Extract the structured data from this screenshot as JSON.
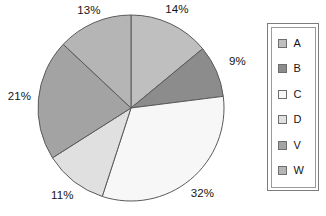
{
  "chart_data": {
    "type": "pie",
    "title": "",
    "legend_position": "right",
    "categories": [
      "A",
      "B",
      "C",
      "D",
      "V",
      "W"
    ],
    "values": [
      14,
      9,
      32,
      11,
      21,
      13
    ],
    "labels": [
      "14%",
      "9%",
      "32%",
      "11%",
      "21%",
      "13%"
    ],
    "colors": [
      "#bfbfbf",
      "#8c8c8c",
      "#f7f7f7",
      "#e0e0e0",
      "#a3a3a3",
      "#b5b5b5"
    ],
    "start_angle_deg": 0,
    "direction": "clockwise",
    "slices": [
      {
        "category": "A",
        "value": 14,
        "label": "14%",
        "color": "#bfbfbf"
      },
      {
        "category": "B",
        "value": 9,
        "label": "9%",
        "color": "#8c8c8c"
      },
      {
        "category": "C",
        "value": 32,
        "label": "32%",
        "color": "#f7f7f7"
      },
      {
        "category": "D",
        "value": 11,
        "label": "11%",
        "color": "#e0e0e0"
      },
      {
        "category": "V",
        "value": 21,
        "label": "21%",
        "color": "#a3a3a3"
      },
      {
        "category": "W",
        "value": 13,
        "label": "13%",
        "color": "#b5b5b5"
      }
    ]
  },
  "legend": {
    "items": [
      {
        "label": "A",
        "color": "#bfbfbf"
      },
      {
        "label": "B",
        "color": "#8c8c8c"
      },
      {
        "label": "C",
        "color": "#f7f7f7"
      },
      {
        "label": "D",
        "color": "#e0e0e0"
      },
      {
        "label": "V",
        "color": "#a3a3a3"
      },
      {
        "label": "W",
        "color": "#b5b5b5"
      }
    ]
  },
  "style": {
    "slice_outline": "#5a5a5a",
    "legend_border": "#7d7d7d",
    "text_color": "#141414",
    "background": "#ffffff"
  }
}
